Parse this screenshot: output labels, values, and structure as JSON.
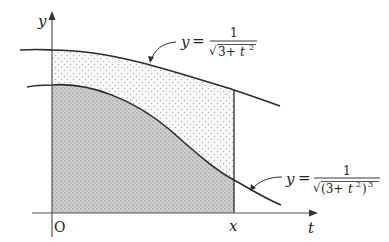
{
  "diagram": {
    "type": "area-between-curves",
    "axes": {
      "vertical_label": "y",
      "horizontal_label": "t",
      "origin_label": "O",
      "marker_label": "x"
    },
    "curves": [
      {
        "id": "upper",
        "label_lhs": "y",
        "label_eq": "=",
        "numerator": "1",
        "denominator": "√3+t²",
        "denominator_parts": {
          "radical": "√",
          "base": "3+",
          "var": "t",
          "exp": "2"
        },
        "region_fill": "light dotted"
      },
      {
        "id": "lower",
        "label_lhs": "y",
        "label_eq": "=",
        "numerator": "1",
        "denominator": "√(3+t²)³",
        "denominator_parts": {
          "radical": "√",
          "base": "(3+",
          "var": "t",
          "exp": "2",
          "close": ")",
          "outer_exp": "3"
        },
        "region_fill": "gray dotted"
      }
    ],
    "colors": {
      "line": "#2a2a2a",
      "light_region": "#f4f4f4",
      "dark_region": "#c8c8c8",
      "dots": "#8a8a8a"
    }
  }
}
